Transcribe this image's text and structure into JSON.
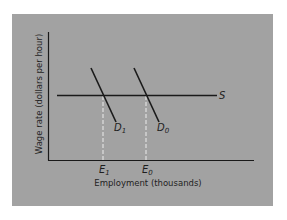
{
  "diagram": {
    "background_color": "#a2a2a2",
    "line_color": "#1a1a1a",
    "dashed_color": "#ececec",
    "y_axis": {
      "label": "Wage rate (dollars per hour)"
    },
    "x_axis": {
      "label": "Employment (thousands)",
      "ticks": [
        {
          "main": "E",
          "sub": "1"
        },
        {
          "main": "E",
          "sub": "0"
        }
      ]
    },
    "curves": {
      "supply": {
        "label": "S"
      },
      "demand_new": {
        "main": "D",
        "sub": "1"
      },
      "demand_original": {
        "main": "D",
        "sub": "0"
      }
    }
  }
}
